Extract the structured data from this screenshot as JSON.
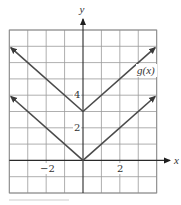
{
  "chart_data": {
    "type": "line",
    "title": "",
    "xlabel": "x",
    "ylabel": "y",
    "xlim": [
      -4,
      4
    ],
    "ylim": [
      -2,
      8
    ],
    "grid": true,
    "grid_step": 1,
    "x_tick_labels": [
      {
        "value": -2,
        "label": "−2"
      },
      {
        "value": 2,
        "label": "2"
      }
    ],
    "y_tick_labels": [
      {
        "value": 2,
        "label": "2"
      },
      {
        "value": 4,
        "label": "4"
      }
    ],
    "series": [
      {
        "name": "f(x) = |x|",
        "label": "",
        "points": [
          [
            -4,
            4
          ],
          [
            0,
            0
          ],
          [
            4,
            4
          ]
        ],
        "arrows_at_ends": true
      },
      {
        "name": "g(x) = |x| + 3",
        "label": "g(x)",
        "points": [
          [
            -4,
            7
          ],
          [
            0,
            3
          ],
          [
            4,
            7
          ]
        ],
        "arrows_at_ends": true
      }
    ],
    "annotations": [
      {
        "text": "g(x)",
        "x": 3.0,
        "y": 5.4
      }
    ],
    "colors": {
      "curve": "#4a4a4a",
      "axis": "#2a2a2a",
      "grid": "#9a9a9a"
    }
  },
  "labels": {
    "x_axis": "x",
    "y_axis": "y",
    "x_tick_neg2": "−2",
    "x_tick_2": "2",
    "y_tick_2": "2",
    "y_tick_4": "4",
    "series_g": "g(x)"
  }
}
